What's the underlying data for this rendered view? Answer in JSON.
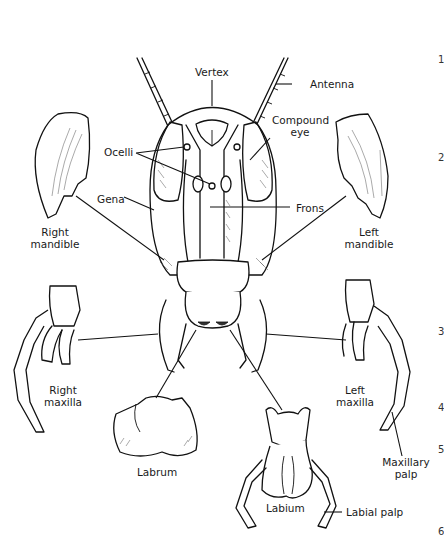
{
  "figure": {
    "labels": {
      "vertex": "Vertex",
      "antenna": "Antenna",
      "compound_eye_line1": "Compound",
      "compound_eye_line2": "eye",
      "ocelli": "Ocelli",
      "gena": "Gena",
      "frons": "Frons",
      "right_mandible_line1": "Right",
      "right_mandible_line2": "mandible",
      "left_mandible_line1": "Left",
      "left_mandible_line2": "mandible",
      "right_maxilla_line1": "Right",
      "right_maxilla_line2": "maxilla",
      "left_maxilla_line1": "Left",
      "left_maxilla_line2": "maxilla",
      "maxillary_palp_line1": "Maxillary",
      "maxillary_palp_line2": "palp",
      "labrum": "Labrum",
      "labium": "Labium",
      "labial_palp": "Labial palp"
    },
    "margin_numbers": [
      "1",
      "2",
      "3",
      "4",
      "5",
      "6"
    ]
  }
}
